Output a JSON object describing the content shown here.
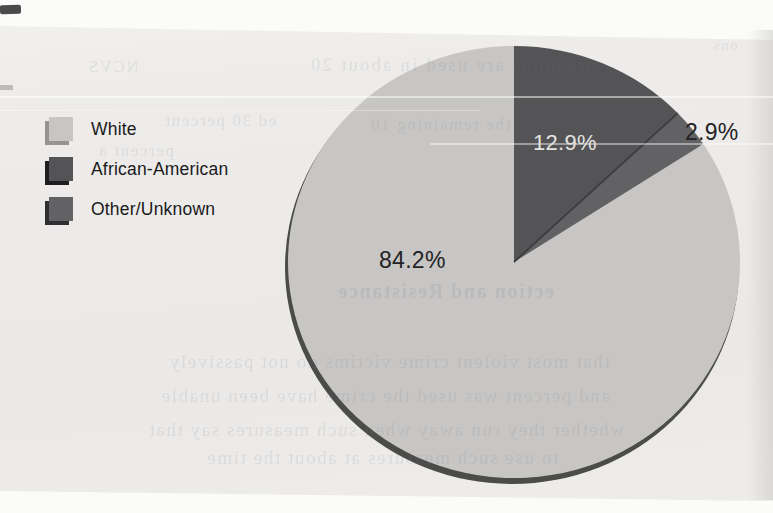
{
  "chart_data": {
    "type": "pie",
    "categories": [
      "White",
      "African-American",
      "Other/Unknown"
    ],
    "values": [
      84.2,
      12.9,
      2.9
    ],
    "slice_labels": [
      "84.2%",
      "12.9%",
      "2.9%"
    ],
    "colors": [
      "#c7c6c4",
      "#545456",
      "#626264"
    ],
    "start_angle_deg": 0,
    "direction": "clockwise",
    "draw_order": [
      1,
      2,
      0
    ],
    "legend_position": "left",
    "title": ""
  },
  "legend": {
    "items": [
      {
        "label": "White"
      },
      {
        "label": "African-American"
      },
      {
        "label": "Other/Unknown"
      }
    ]
  },
  "bleed_text": {
    "f1": "ons",
    "f2": "NCVS",
    "f3": "weapons are used in about 20",
    "f4": "ed 30 percent",
    "f5": "the remaining 10",
    "f6": "percent a",
    "f7": "ection and Resistance",
    "f8": "that most violent crime victims do not passively",
    "f9": "and percent was used the crime have been unable",
    "f10": "whether they run away when such measures say that",
    "f11": "to use such measures at about the time"
  }
}
